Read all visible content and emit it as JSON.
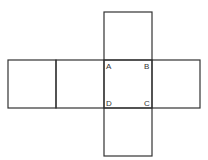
{
  "diagram": {
    "stroke_color": "#333333",
    "background": "#ffffff",
    "square_size": 48,
    "squares": [
      {
        "id": "top",
        "x": 104,
        "y": 12
      },
      {
        "id": "left-outer",
        "x": 8,
        "y": 60
      },
      {
        "id": "left-inner",
        "x": 56,
        "y": 60
      },
      {
        "id": "center",
        "x": 104,
        "y": 60
      },
      {
        "id": "right",
        "x": 152,
        "y": 60
      },
      {
        "id": "bottom",
        "x": 104,
        "y": 108
      }
    ],
    "labels": [
      {
        "text": "A",
        "x": 106,
        "y": 69
      },
      {
        "text": "B",
        "x": 144,
        "y": 69
      },
      {
        "text": "D",
        "x": 106,
        "y": 106
      },
      {
        "text": "C",
        "x": 144,
        "y": 106
      }
    ]
  }
}
